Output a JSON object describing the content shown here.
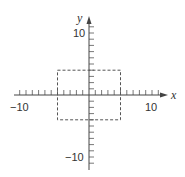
{
  "chart_data": {
    "type": "line",
    "title": "",
    "xlabel": "x",
    "ylabel": "y",
    "xlim": [
      -12,
      12
    ],
    "ylim": [
      -12,
      12
    ],
    "x_tick_labels": [
      "-10",
      "10"
    ],
    "y_tick_labels": [
      "10",
      "-10"
    ],
    "tick_spacing": 1,
    "grid": false,
    "legend": null,
    "series": [
      {
        "name": "dashed rectangle",
        "style": "dashed",
        "x": [
          -5,
          5,
          5,
          -5,
          -5
        ],
        "y": [
          4,
          4,
          -4,
          -4,
          4
        ]
      }
    ]
  },
  "labels": {
    "x_axis": "x",
    "y_axis": "y",
    "x_neg": "−10",
    "x_pos": "10",
    "y_pos": "10",
    "y_neg": "−10"
  }
}
